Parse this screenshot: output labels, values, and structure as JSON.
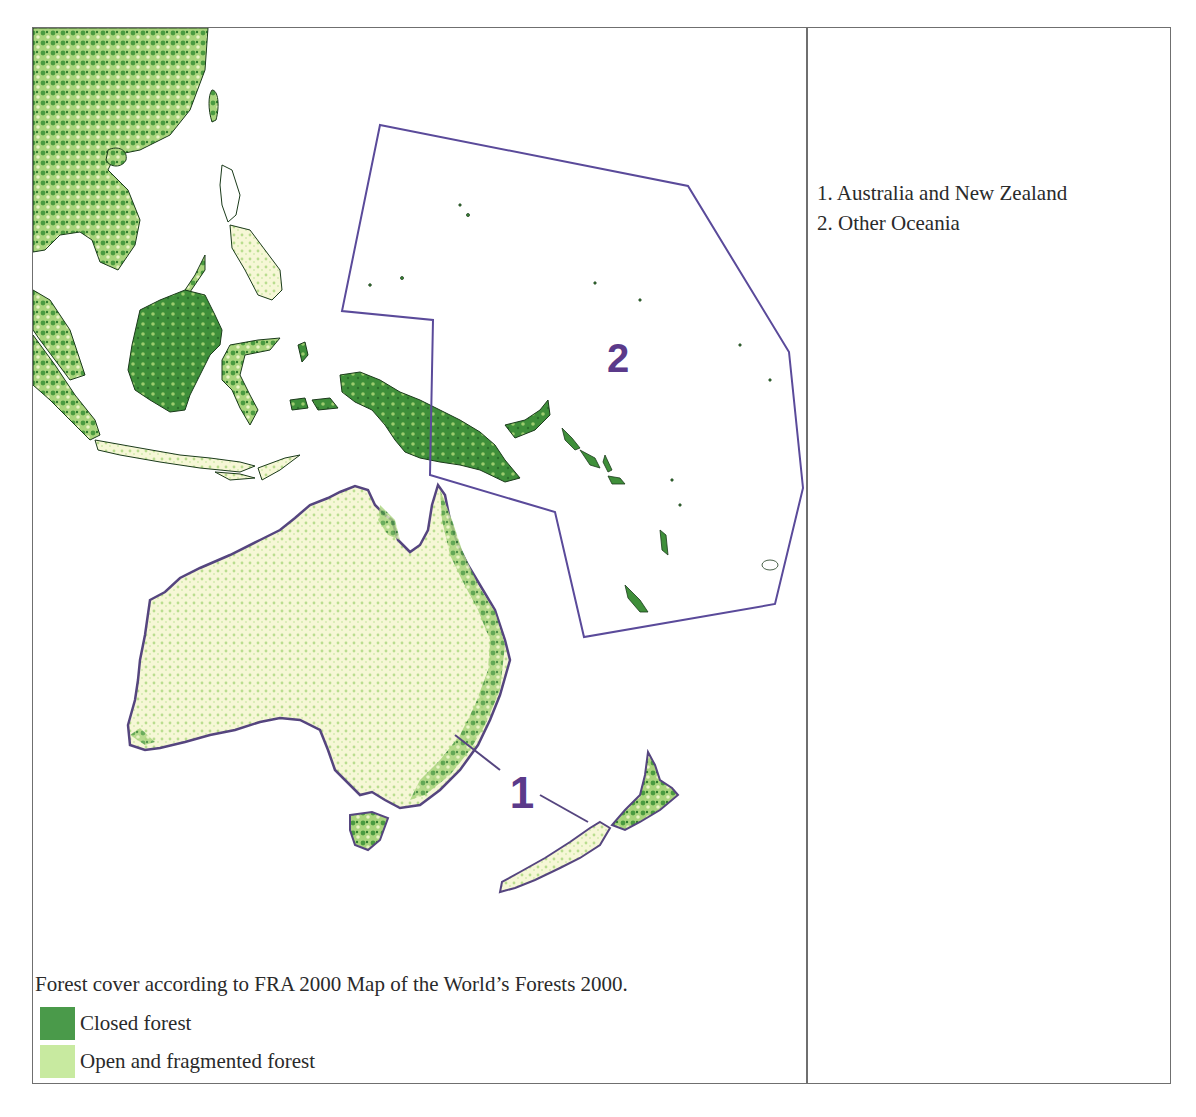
{
  "region_list": {
    "items": [
      {
        "number": "1",
        "label": "1. Australia and New Zealand"
      },
      {
        "number": "2",
        "label": "2. Other Oceania"
      }
    ]
  },
  "map": {
    "region_labels": [
      {
        "id": "1",
        "text": "1",
        "target": "Australia and New Zealand"
      },
      {
        "id": "2",
        "text": "2",
        "target": "Other Oceania"
      }
    ],
    "boundary_color": "#5a4a9a",
    "label_color": "#5b3a8a"
  },
  "legend": {
    "caption": "Forest cover according to FRA 2000 Map of the World’s Forests 2000.",
    "items": [
      {
        "label": "Closed forest",
        "color": "#4a9a4a"
      },
      {
        "label": "Open and fragmented forest",
        "color": "#c8eaa0"
      }
    ]
  }
}
